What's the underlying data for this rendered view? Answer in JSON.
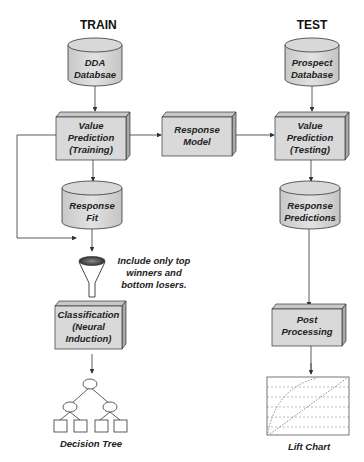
{
  "headers": {
    "train": "TRAIN",
    "test": "TEST"
  },
  "nodes": {
    "dda_database": {
      "line1": "DDA",
      "line2": "Databsae",
      "shape": "cylinder"
    },
    "value_pred_training": {
      "line1": "Value",
      "line2": "Prediction",
      "line3": "(Training)",
      "shape": "box"
    },
    "response_model": {
      "line1": "Response",
      "line2": "Model",
      "shape": "box"
    },
    "prospect_database": {
      "line1": "Prospect",
      "line2": "Database",
      "shape": "cylinder"
    },
    "value_pred_testing": {
      "line1": "Value",
      "line2": "Prediction",
      "line3": "(Testing)",
      "shape": "box"
    },
    "response_fit": {
      "line1": "Response",
      "line2": "Fit",
      "shape": "cylinder"
    },
    "response_predictions": {
      "line1": "Response",
      "line2": "Predictions",
      "shape": "cylinder"
    },
    "classification": {
      "line1": "Classification",
      "line2": "(Neural",
      "line3": "Induction)",
      "shape": "box"
    },
    "post_processing": {
      "line1": "Post",
      "line2": "Processing",
      "shape": "box"
    },
    "filter_note": {
      "line1": "Include only top",
      "line2": "winners and",
      "line3": "bottom losers."
    },
    "decision_tree": {
      "label": "Decision Tree",
      "icon": "tree-icon"
    },
    "lift_chart": {
      "label": "Lift Chart",
      "icon": "chart-icon"
    }
  },
  "colors": {
    "fill": "#d9d9d9",
    "fill_side": "#b8b8b8",
    "stroke": "#333333",
    "funnel_top": "#555555"
  }
}
